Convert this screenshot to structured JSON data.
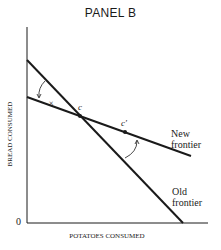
{
  "title": "PANEL B",
  "axes": {
    "xlabel": "POTATOES CONSUMED",
    "ylabel": "BREAD CONSUMED",
    "origin": "0"
  },
  "lines": {
    "new_frontier": [
      "New",
      "frontier"
    ],
    "old_frontier": [
      "Old",
      "frontier"
    ]
  },
  "points": {
    "c": "c",
    "c_prime": "c′",
    "x_mark": "×"
  }
}
